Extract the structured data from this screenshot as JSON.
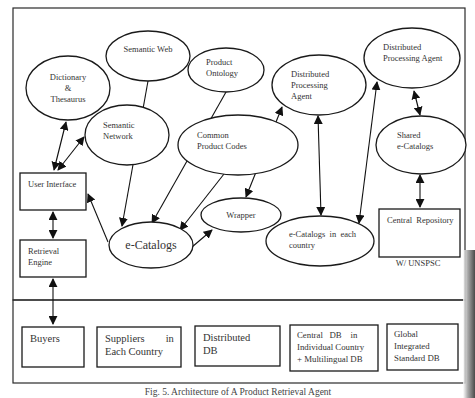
{
  "figure": {
    "caption": "Fig. 5. Architecture of A Product Retrieval Agent"
  },
  "nodes": {
    "dictionary": [
      "Dictionary",
      "&",
      "Thesaurus"
    ],
    "semantic_web": [
      "Semantic Web"
    ],
    "product_ontology": [
      "Product",
      "Ontology"
    ],
    "semantic_network": [
      "Semantic",
      "Network"
    ],
    "common_product_codes": [
      "Common",
      "Product Codes"
    ],
    "dpa_middle": [
      "Distributed",
      "Processing",
      "Agent"
    ],
    "dpa_right": [
      "Distributed",
      "Processing Agent"
    ],
    "shared_ecatalogs": [
      "Shared",
      "e-Catalogs"
    ],
    "user_interface": [
      "User Interface"
    ],
    "retrieval_engine": [
      "Retrieval",
      "Engine"
    ],
    "ecatalogs": [
      "e-Catalogs"
    ],
    "wrapper": [
      "Wrapper"
    ],
    "ecatalogs_country": [
      "e-Catalogs  in  each",
      "country"
    ],
    "central_repository": [
      "Central  Repository"
    ],
    "central_repository_note": "W/ UNSPSC"
  },
  "databases": [
    {
      "id": "buyers",
      "lines": [
        "Buyers"
      ]
    },
    {
      "id": "suppliers",
      "lines": [
        "Suppliers        in",
        "Each Country"
      ]
    },
    {
      "id": "distributed-db",
      "lines": [
        "Distributed",
        "DB"
      ]
    },
    {
      "id": "central-db",
      "lines": [
        "Central   DB    in",
        "Individual Country",
        "+ Multilingual DB"
      ]
    },
    {
      "id": "global-db",
      "lines": [
        "Global",
        "Integrated",
        "Standard DB"
      ]
    }
  ],
  "edges": [
    {
      "from": "user_interface",
      "to": "dictionary",
      "type": "bidirectional"
    },
    {
      "from": "user_interface",
      "to": "semantic_network",
      "type": "bidirectional"
    },
    {
      "from": "user_interface",
      "to": "retrieval_engine",
      "type": "bidirectional"
    },
    {
      "from": "retrieval_engine",
      "to": "buyers",
      "type": "bidirectional"
    },
    {
      "from": "ecatalogs",
      "to": "user_interface",
      "type": "directed"
    },
    {
      "from": "semantic_web",
      "to": "ecatalogs",
      "type": "directed"
    },
    {
      "from": "product_ontology",
      "to": "ecatalogs",
      "type": "directed"
    },
    {
      "from": "common_product_codes",
      "to": "ecatalogs",
      "type": "directed"
    },
    {
      "from": "ecatalogs",
      "to": "wrapper",
      "type": "directed"
    },
    {
      "from": "wrapper",
      "to": "dpa_middle",
      "type": "bidirectional"
    },
    {
      "from": "ecatalogs_country",
      "to": "dpa_middle",
      "type": "bidirectional"
    },
    {
      "from": "ecatalogs_country",
      "to": "dpa_right",
      "type": "bidirectional"
    },
    {
      "from": "dpa_right",
      "to": "shared_ecatalogs",
      "type": "bidirectional"
    },
    {
      "from": "shared_ecatalogs",
      "to": "central_repository",
      "type": "bidirectional"
    }
  ]
}
